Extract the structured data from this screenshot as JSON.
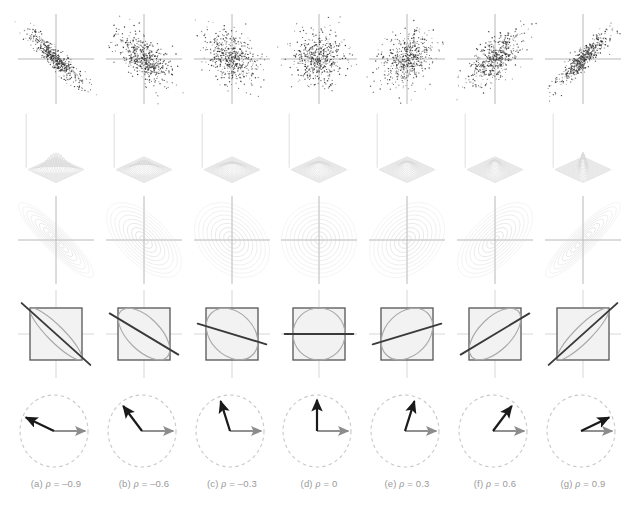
{
  "figure": {
    "columns": 7,
    "rows": 5,
    "background": "#ffffff"
  },
  "colors": {
    "axis": "#b0b0b0",
    "point": "#303030",
    "contour": "#cfcfcf",
    "mesh": "#d8d8d8",
    "square_border": "#555555",
    "square_fill": "#f2f2f2",
    "ellipse": "#a8a8a8",
    "regression_line": "#3a3a3a",
    "dashed_circle": "#c8c8c8",
    "vector_black": "#1a1a1a",
    "vector_gray": "#8c8c8c",
    "caption_text": "#9a9a9a"
  },
  "captions": [
    {
      "letter": "(a)",
      "symbol": "ρ",
      "eq": "=",
      "value": "–0.9"
    },
    {
      "letter": "(b)",
      "symbol": "ρ",
      "eq": "=",
      "value": "–0.6"
    },
    {
      "letter": "(c)",
      "symbol": "ρ",
      "eq": "=",
      "value": "–0.3"
    },
    {
      "letter": "(d)",
      "symbol": "ρ",
      "eq": "=",
      "value": "0"
    },
    {
      "letter": "(e)",
      "symbol": "ρ",
      "eq": "=",
      "value": "0.3"
    },
    {
      "letter": "(f)",
      "symbol": "ρ",
      "eq": "=",
      "value": "0.6"
    },
    {
      "letter": "(g)",
      "symbol": "ρ",
      "eq": "=",
      "value": "0.9"
    }
  ],
  "row_labels": [
    "scatter-plot-row",
    "density-surface-row",
    "contour-plot-row",
    "square-ellipse-regression-row",
    "vector-angle-row"
  ],
  "chart_data": {
    "type": "scatter",
    "xlabel": "x",
    "ylabel": "y",
    "xlim": [
      -3.2,
      3.2
    ],
    "ylim": [
      -3.2,
      3.2
    ],
    "grid": false,
    "legend": "none",
    "panel_variable": "rho",
    "rho_values": [
      -0.9,
      -0.6,
      -0.3,
      0,
      0.3,
      0.6,
      0.9
    ],
    "n_points_per_panel": 500,
    "row_descriptions": [
      "Scatter of 500 samples from a standard bivariate normal with given rho, crosshair axes at origin",
      "3D wireframe mesh of the bivariate normal probability density surface",
      "Nested elliptical density contours, tilt set by sign of rho",
      "Unit square with inscribed tilted ellipse and dark least-squares regression line of slope rho",
      "Dashed unit circle with a gray reference vector and a black vector separated by angle arccos(rho)"
    ],
    "vector_angles_degrees": [
      154.2,
      126.9,
      107.5,
      90.0,
      72.5,
      53.1,
      25.8
    ],
    "ellipse_tilt_degrees": [
      -45,
      -45,
      -45,
      0,
      45,
      45,
      45
    ],
    "regression_slopes": [
      -0.9,
      -0.6,
      -0.3,
      0,
      0.3,
      0.6,
      0.9
    ],
    "contour_levels": 9,
    "series": [
      {
        "name": "rho = -0.9",
        "rho": -0.9,
        "angle_deg": 154.2,
        "slope": -0.9
      },
      {
        "name": "rho = -0.6",
        "rho": -0.6,
        "angle_deg": 126.9,
        "slope": -0.6
      },
      {
        "name": "rho = -0.3",
        "rho": -0.3,
        "angle_deg": 107.5,
        "slope": -0.3
      },
      {
        "name": "rho = 0",
        "rho": 0,
        "angle_deg": 90.0,
        "slope": 0
      },
      {
        "name": "rho = 0.3",
        "rho": 0.3,
        "angle_deg": 72.5,
        "slope": 0.3
      },
      {
        "name": "rho = 0.6",
        "rho": 0.6,
        "angle_deg": 53.1,
        "slope": 0.6
      },
      {
        "name": "rho = 0.9",
        "rho": 0.9,
        "angle_deg": 25.8,
        "slope": 0.9
      }
    ]
  }
}
